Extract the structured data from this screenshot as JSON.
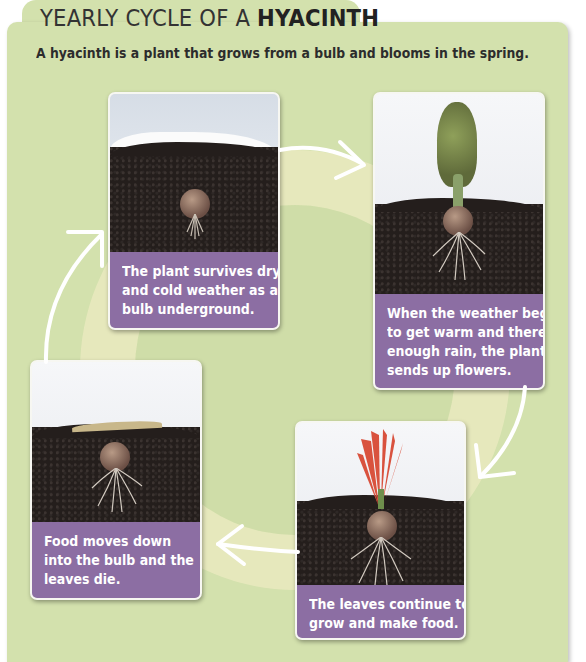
{
  "header": {
    "title_prefix": "YEARLY CYCLE OF A ",
    "title_emphasis": "HYACINTH",
    "subtitle": "A hyacinth is a plant that grows from a bulb and blooms in the spring."
  },
  "colors": {
    "panel": "#d3e1ad",
    "caption": "#8c6ea3",
    "soil": "#241e1c",
    "arrow": "#ffffff"
  },
  "stages": [
    {
      "id": "dormant",
      "image": "bulb-under-snow",
      "lines": [
        "The plant survives dry",
        "and cold weather as a",
        "bulb underground."
      ]
    },
    {
      "id": "flowering",
      "image": "hyacinth-flower-bloom",
      "lines": [
        "When the weather begins",
        "to get warm and there is",
        "enough rain, the plant",
        "sends up flowers."
      ]
    },
    {
      "id": "leaves-die",
      "image": "bulb-dying-leaves",
      "lines": [
        "Food moves down",
        "into the bulb and the",
        "leaves die."
      ]
    },
    {
      "id": "leaves-grow",
      "image": "bulb-green-leaves",
      "lines": [
        "The leaves continue to",
        "grow and make food."
      ]
    }
  ],
  "arrows": [
    "arrow-dormant-to-flowering",
    "arrow-flowering-to-leaves-grow",
    "arrow-leaves-grow-to-leaves-die",
    "arrow-leaves-die-to-dormant"
  ]
}
